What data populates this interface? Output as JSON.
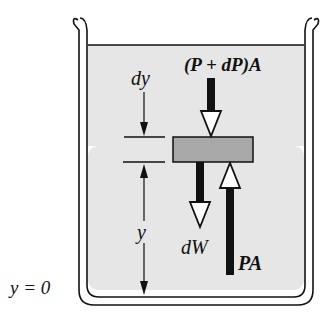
{
  "diagram": {
    "type": "free-body diagram of fluid element in container",
    "labels": {
      "top_force": "(P + dP)A",
      "thickness": "dy",
      "height": "y",
      "weight": "dW",
      "bottom_force": "PA",
      "origin": "y = 0"
    },
    "colors": {
      "fluid": "#e6e6e6",
      "slab": "#a8a8a8",
      "ink": "#111111",
      "background": "#ffffff"
    }
  }
}
